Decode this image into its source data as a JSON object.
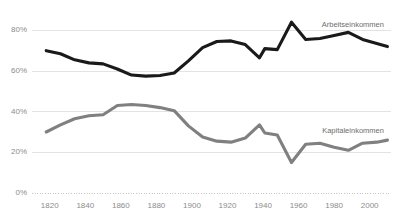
{
  "chart_data": {
    "type": "line",
    "title": "",
    "subtitle": "",
    "xlabel": "",
    "ylabel": "",
    "xlim": [
      1810,
      2012
    ],
    "ylim": [
      0,
      90
    ],
    "grid": true,
    "legend_position": "inline-right",
    "y_ticks": [
      {
        "value": 0,
        "label": "0%"
      },
      {
        "value": 20,
        "label": "20%"
      },
      {
        "value": 40,
        "label": "40%"
      },
      {
        "value": 60,
        "label": "60%"
      },
      {
        "value": 80,
        "label": "80%"
      }
    ],
    "x_ticks": [
      {
        "value": 1820,
        "label": "1820"
      },
      {
        "value": 1840,
        "label": "1840"
      },
      {
        "value": 1860,
        "label": "1860"
      },
      {
        "value": 1880,
        "label": "1880"
      },
      {
        "value": 1900,
        "label": "1900"
      },
      {
        "value": 1920,
        "label": "1920"
      },
      {
        "value": 1940,
        "label": "1940"
      },
      {
        "value": 1960,
        "label": "1960"
      },
      {
        "value": 1980,
        "label": "1980"
      },
      {
        "value": 2000,
        "label": "2000"
      }
    ],
    "series": [
      {
        "name": "Arbeitseinkommen",
        "color": "#1a1a1a",
        "width": 3.1,
        "label_x": 2008,
        "label_y": 82.5,
        "x": [
          1818,
          1826,
          1834,
          1842,
          1850,
          1858,
          1866,
          1874,
          1882,
          1890,
          1898,
          1906,
          1914,
          1922,
          1930,
          1938,
          1941,
          1948,
          1956,
          1964,
          1972,
          1980,
          1988,
          1996,
          2004,
          2010
        ],
        "values": [
          70.0,
          68.5,
          65.5,
          64.0,
          63.5,
          61.0,
          58.0,
          57.5,
          57.8,
          59.0,
          65.0,
          71.5,
          74.5,
          74.8,
          73.0,
          66.5,
          71.0,
          70.5,
          84.0,
          75.5,
          76.0,
          77.5,
          79.0,
          75.5,
          73.5,
          72.0
        ]
      },
      {
        "name": "Kapitaleinkommen",
        "color": "#808080",
        "width": 3.1,
        "label_x": 2008,
        "label_y": 30.5,
        "x": [
          1818,
          1826,
          1834,
          1842,
          1850,
          1858,
          1866,
          1874,
          1882,
          1890,
          1898,
          1906,
          1914,
          1922,
          1930,
          1938,
          1941,
          1948,
          1956,
          1964,
          1972,
          1980,
          1988,
          1996,
          2004,
          2010
        ],
        "values": [
          30.0,
          33.5,
          36.5,
          38.0,
          38.5,
          43.0,
          43.5,
          43.0,
          42.0,
          40.5,
          33.0,
          27.5,
          25.5,
          25.0,
          27.0,
          33.5,
          29.5,
          28.5,
          15.0,
          24.0,
          24.5,
          22.5,
          21.0,
          24.5,
          25.0,
          26.0
        ]
      }
    ]
  }
}
